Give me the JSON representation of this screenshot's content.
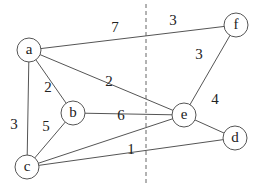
{
  "graph": {
    "nodes": [
      {
        "id": "a",
        "label": "a",
        "x": 29,
        "y": 50
      },
      {
        "id": "b",
        "label": "b",
        "x": 73,
        "y": 113
      },
      {
        "id": "c",
        "label": "c",
        "x": 27,
        "y": 167
      },
      {
        "id": "d",
        "label": "d",
        "x": 235,
        "y": 138
      },
      {
        "id": "e",
        "label": "e",
        "x": 184,
        "y": 115
      },
      {
        "id": "f",
        "label": "f",
        "x": 236,
        "y": 25
      }
    ],
    "edges": [
      {
        "from": "a",
        "to": "f",
        "weight": "7",
        "lx": 115,
        "ly": 32
      },
      {
        "from": "a",
        "to": "f",
        "weight": "3",
        "lx": 173,
        "ly": 25,
        "note": "second label on a-f edge right of cut"
      },
      {
        "from": "a",
        "to": "b",
        "weight": "2",
        "lx": 48,
        "ly": 92
      },
      {
        "from": "a",
        "to": "e",
        "weight": "2",
        "lx": 109,
        "ly": 86
      },
      {
        "from": "a",
        "to": "c",
        "weight": "3",
        "lx": 14,
        "ly": 129
      },
      {
        "from": "b",
        "to": "c",
        "weight": "5",
        "lx": 46,
        "ly": 131
      },
      {
        "from": "b",
        "to": "e",
        "weight": "",
        "lx": 0,
        "ly": 0
      },
      {
        "from": "c",
        "to": "e",
        "weight": "6",
        "lx": 121,
        "ly": 120
      },
      {
        "from": "c",
        "to": "d",
        "weight": "1",
        "lx": 131,
        "ly": 154
      },
      {
        "from": "e",
        "to": "f",
        "weight": "3",
        "lx": 199,
        "ly": 59
      },
      {
        "from": "e",
        "to": "d",
        "weight": "4",
        "lx": 215,
        "ly": 104
      }
    ],
    "cut_line": {
      "x": 146,
      "y1": 4,
      "y2": 186,
      "style": "dashed"
    }
  }
}
